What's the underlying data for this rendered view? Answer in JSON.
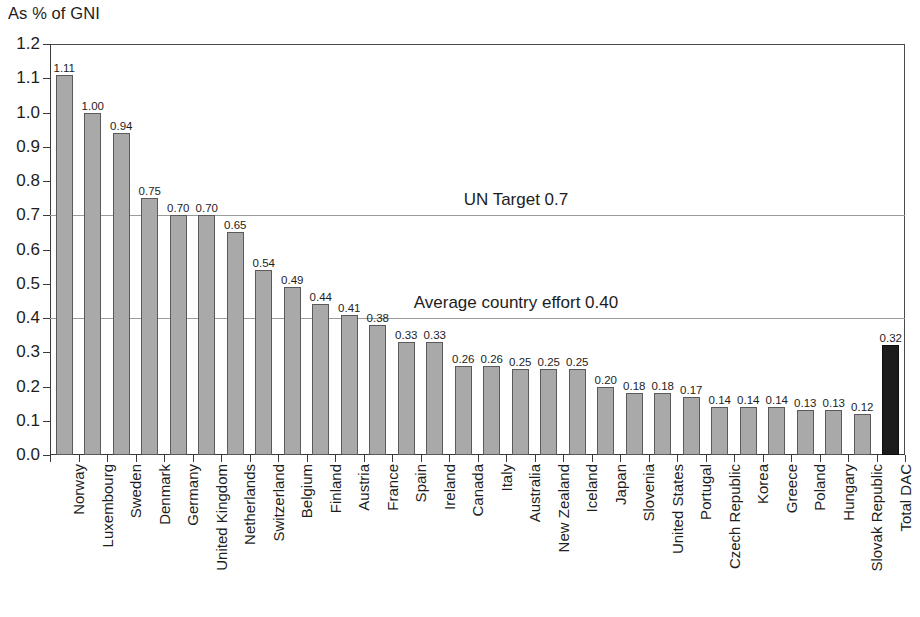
{
  "chart_data": {
    "type": "bar",
    "title": "As % of GNI",
    "xlabel": "",
    "ylabel": "As % of GNI",
    "ylim": [
      0.0,
      1.2
    ],
    "ytick_labels": [
      "1.2",
      "1.1",
      "1.0",
      "0.9",
      "0.8",
      "0.7",
      "0.6",
      "0.5",
      "0.4",
      "0.3",
      "0.2",
      "0.1",
      "0.0"
    ],
    "ytick_values": [
      1.2,
      1.1,
      1.0,
      0.9,
      0.8,
      0.7,
      0.6,
      0.5,
      0.4,
      0.3,
      0.2,
      0.1,
      0.0
    ],
    "grid": true,
    "gridlines_at": [
      1.2,
      0.7,
      0.4
    ],
    "legend": [],
    "categories": [
      "Norway",
      "Luxembourg",
      "Sweden",
      "Denmark",
      "Germany",
      "United Kingdom",
      "Netherlands",
      "Switzerland",
      "Belgium",
      "Finland",
      "Austria",
      "France",
      "Spain",
      "Ireland",
      "Canada",
      "Italy",
      "Australia",
      "New Zealand",
      "Iceland",
      "Japan",
      "Slovenia",
      "United States",
      "Portugal",
      "Czech Republic",
      "Korea",
      "Greece",
      "Poland",
      "Hungary",
      "Slovak Republic",
      "Total DAC"
    ],
    "values": [
      1.11,
      1.0,
      0.94,
      0.75,
      0.7,
      0.7,
      0.65,
      0.54,
      0.49,
      0.44,
      0.41,
      0.38,
      0.33,
      0.33,
      0.26,
      0.26,
      0.25,
      0.25,
      0.25,
      0.2,
      0.18,
      0.18,
      0.17,
      0.14,
      0.14,
      0.14,
      0.13,
      0.13,
      0.12,
      0.32
    ],
    "value_labels": [
      "1.11",
      "1.00",
      "0.94",
      "0.75",
      "0.70",
      "0.70",
      "0.65",
      "0.54",
      "0.49",
      "0.44",
      "0.41",
      "0.38",
      "0.33",
      "0.33",
      "0.26",
      "0.26",
      "0.25",
      "0.25",
      "0.25",
      "0.20",
      "0.18",
      "0.18",
      "0.17",
      "0.14",
      "0.14",
      "0.14",
      "0.13",
      "0.13",
      "0.12",
      "0.32"
    ],
    "highlight_index": 29,
    "bar_color": "#a9a9a9",
    "bar_border_color": "#5a5a5a",
    "highlight_color": "#1c1c1c",
    "annotations": [
      {
        "text": "UN Target 0.7",
        "value": 0.7,
        "x_fraction": 0.545
      },
      {
        "text": "Average country effort 0.40",
        "value": 0.4,
        "x_fraction": 0.545
      }
    ]
  }
}
